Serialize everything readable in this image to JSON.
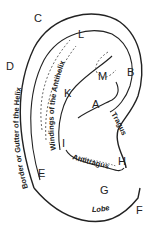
{
  "diagram": {
    "type": "anatomical ear diagram",
    "letter_labels": [
      "A",
      "B",
      "C",
      "D",
      "E",
      "F",
      "G",
      "H",
      "I",
      "K",
      "L",
      "M"
    ],
    "text_labels": {
      "helix_border": "Border or Gutter of the Helix",
      "antihelix": "Windings of the Antihelix",
      "tragus": "Tragus",
      "antitragus": "Antitragus",
      "lobe": "Lobe"
    },
    "letters": {
      "A": "A",
      "B": "B",
      "C": "C",
      "D": "D",
      "E": "E",
      "F": "F",
      "G": "G",
      "H": "H",
      "I": "I",
      "K": "K",
      "L": "L",
      "M": "M"
    },
    "stroke_color": "#222222",
    "background_color": "#ffffff"
  }
}
